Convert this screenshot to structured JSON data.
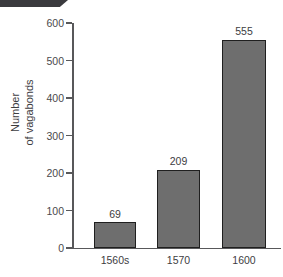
{
  "figure": {
    "banner_present": true,
    "background_color": "#ffffff"
  },
  "chart_data": {
    "type": "bar",
    "title": "",
    "subtitle": "",
    "categories": [
      "1560s",
      "1570",
      "1600"
    ],
    "values": [
      69,
      209,
      555
    ],
    "data_labels": [
      "69",
      "209",
      "555"
    ],
    "xlabel": "",
    "ylabel_lines": [
      "Number",
      "of vagabonds"
    ],
    "ylabel": "Number of vagabonds",
    "ylim": [
      0,
      600
    ],
    "yticks": [
      0,
      100,
      200,
      300,
      400,
      500,
      600
    ],
    "ytick_labels": [
      "0",
      "100",
      "200",
      "300",
      "400",
      "500",
      "600"
    ],
    "grid": false,
    "legend": null,
    "bar_fill_color": "#6e6e6e",
    "bar_edge_color": "#1f1f1f",
    "axis_color": "#58585a",
    "text_color": "#3d3d3f"
  }
}
